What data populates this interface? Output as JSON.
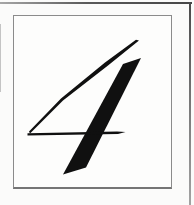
{
  "figure": {
    "numeral": "4",
    "glyph_color": "#101010",
    "background_color": "#fbfbfa",
    "frame": {
      "border_color": "#8b8b8b",
      "bottom_border_color": "#757575",
      "fill_color": "#fdfdfc"
    },
    "scan_artifacts": {
      "top_edge_color": "#5a5a5a",
      "right_edge_color": "#6f6f6f",
      "left_mark_color": "#c4c4c4"
    }
  },
  "glyph": {
    "strokes": [
      {
        "name": "numeral-4-thin-diagonal-stroke",
        "points": "139,40.5 108,65.5 63,100.5 30,133.5 29,131.5 61,98.5 105,62.5 136,39.8"
      },
      {
        "name": "numeral-4-stem-stroke",
        "points": "123,64 141,58 86,167.5 63,174.5"
      },
      {
        "name": "numeral-4-crossbar-stroke",
        "points": "27.5,133.3 117,131.5 125.5,132.1 118,133.9 27.5,135.5"
      }
    ]
  }
}
